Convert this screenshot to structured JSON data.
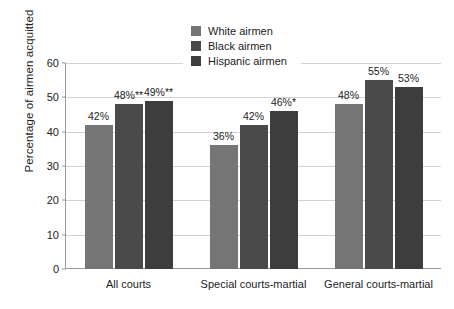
{
  "chart_data": {
    "type": "bar",
    "title": "",
    "xlabel": "",
    "ylabel": "Percentage of airmen acquitted",
    "ylim": [
      0,
      60
    ],
    "yticks": [
      0,
      10,
      20,
      30,
      40,
      50,
      60
    ],
    "ytick_labels": [
      "0",
      "10",
      "20",
      "30",
      "40",
      "50",
      "60"
    ],
    "grid": true,
    "legend_position": "top-center",
    "categories": [
      "All courts",
      "Special courts-martial",
      "General courts-martial"
    ],
    "series": [
      {
        "name": "White airmen",
        "color": "#757575",
        "values": [
          42,
          36,
          48
        ],
        "labels": [
          "42%",
          "36%",
          "48%"
        ]
      },
      {
        "name": "Black airmen",
        "color": "#4a4a4a",
        "values": [
          48,
          42,
          55
        ],
        "labels": [
          "48%**",
          "42%",
          "55%"
        ]
      },
      {
        "name": "Hispanic airmen",
        "color": "#3d3d3d",
        "values": [
          49,
          46,
          53
        ],
        "labels": [
          "49%**",
          "46%*",
          "53%"
        ]
      }
    ]
  },
  "legend": {
    "items": [
      {
        "label": "White airmen",
        "color": "#757575"
      },
      {
        "label": "Black airmen",
        "color": "#4a4a4a"
      },
      {
        "label": "Hispanic airmen",
        "color": "#3d3d3d"
      }
    ]
  },
  "colors": {
    "background": "#ffffff",
    "gridline": "#d2d2d2",
    "axis": "#9a9a9a",
    "text": "#1d1d1d"
  }
}
